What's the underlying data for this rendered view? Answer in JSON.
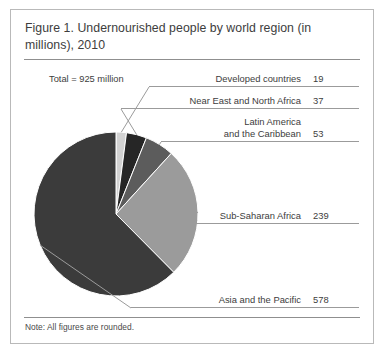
{
  "figure": {
    "title": "Figure 1. Undernourished people by world region (in millions), 2010",
    "total_label": "Total = 925 million",
    "note": "Note: All figures are rounded."
  },
  "chart_data": {
    "type": "pie",
    "title": "Figure 1. Undernourished people by world region (in millions), 2010",
    "unit": "millions",
    "total": 925,
    "total_label": "Total = 925 million",
    "note": "Note: All figures are rounded.",
    "legend": "none",
    "labels_position": "callout-right",
    "start_angle_deg": 0,
    "direction": "clockwise",
    "categories": [
      "Developed countries",
      "Near East and North Africa",
      "Latin America and the Caribbean",
      "Sub-Saharan Africa",
      "Asia and the Pacific"
    ],
    "values": [
      19,
      37,
      53,
      239,
      578
    ],
    "percentages": [
      2.1,
      4.0,
      5.7,
      25.8,
      62.5
    ],
    "colors": [
      "#d2d2d2",
      "#262626",
      "#5c5c5c",
      "#9b9b9b",
      "#3b3b3b"
    ],
    "slices": [
      {
        "label": "Developed countries",
        "value": 19,
        "value_text": "19",
        "percent": 2.1,
        "color": "#d2d2d2"
      },
      {
        "label": "Near East and North Africa",
        "value": 37,
        "value_text": "37",
        "percent": 4.0,
        "color": "#262626"
      },
      {
        "label": "Latin America and the Caribbean",
        "value": 53,
        "value_text": "53",
        "percent": 5.7,
        "color": "#5c5c5c",
        "label_line1": "Latin America",
        "label_line2": "and the Caribbean"
      },
      {
        "label": "Sub-Saharan Africa",
        "value": 239,
        "value_text": "239",
        "percent": 25.8,
        "color": "#9b9b9b"
      },
      {
        "label": "Asia and the Pacific",
        "value": 578,
        "value_text": "578",
        "percent": 62.5,
        "color": "#3b3b3b"
      }
    ]
  }
}
